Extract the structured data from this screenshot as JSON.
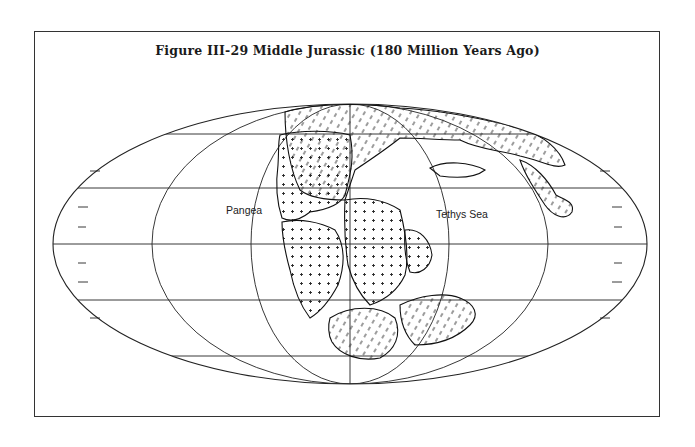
{
  "figure": {
    "title": "Figure III-29  Middle Jurassic (180 Million Years Ago)"
  },
  "map": {
    "projection": "Mollweide (elliptical equal-area)",
    "labels": [
      {
        "id": "pangea",
        "text": "Pangea",
        "x": 226,
        "y": 214
      },
      {
        "id": "tethys",
        "text": "Tethys Sea",
        "x": 436,
        "y": 218
      }
    ],
    "colors": {
      "ink": "#222222",
      "paper": "#ffffff"
    }
  }
}
